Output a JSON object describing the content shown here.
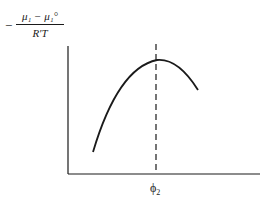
{
  "diagram": {
    "type": "schematic-curve",
    "y_axis_label": {
      "prefix": "−",
      "numerator": "μ₁ − μ₁°",
      "denominator": "R′T"
    },
    "x_axis_label": {
      "symbol": "ϕ",
      "subscript": "2"
    },
    "curve": "single maximum (inverted parabola)",
    "marker": "dashed vertical line through maximum",
    "colors": {
      "stroke": "#1a1a1a",
      "background": "#ffffff"
    }
  }
}
